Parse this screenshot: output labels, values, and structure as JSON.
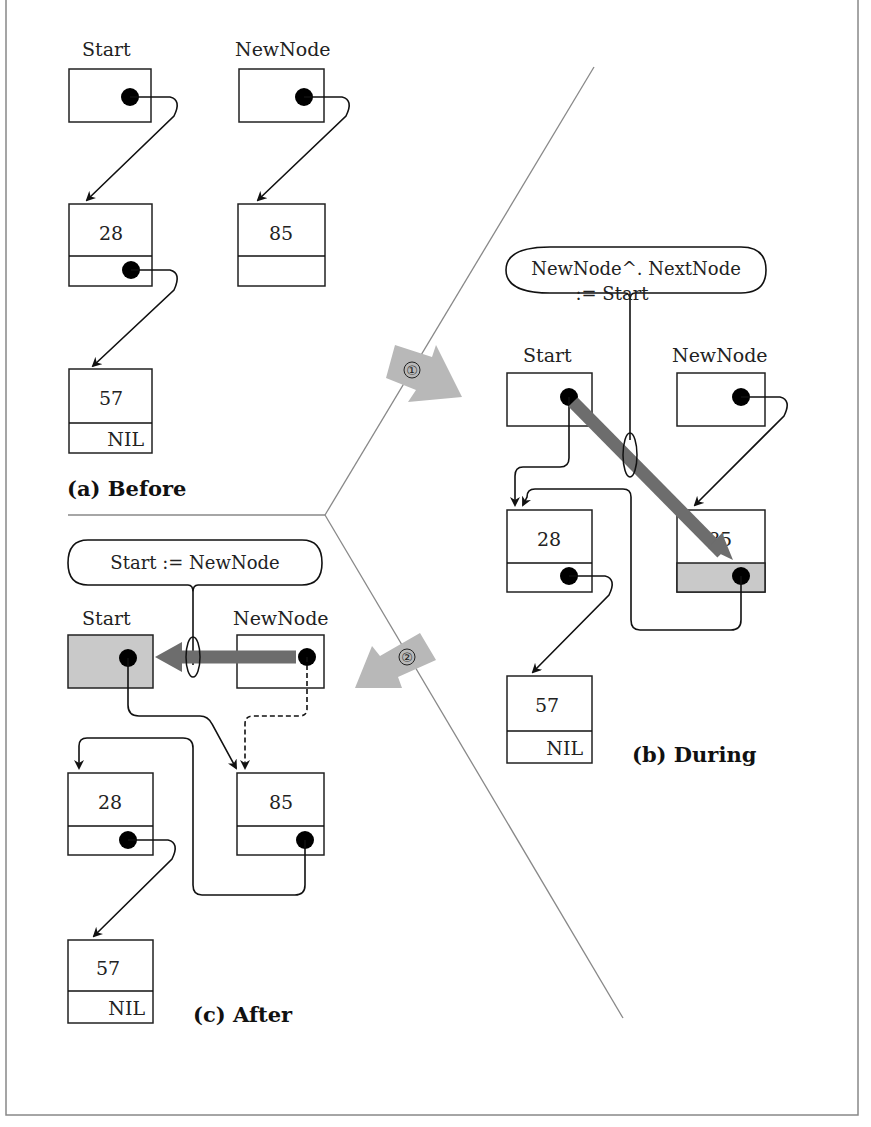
{
  "figure": {
    "panels": {
      "before": {
        "caption": "(a)  Before",
        "pointers": [
          {
            "name": "Start",
            "points_to": "28"
          },
          {
            "name": "NewNode",
            "points_to": "85"
          }
        ],
        "nodes": [
          {
            "value": "28",
            "next": "57"
          },
          {
            "value": "85",
            "next": ""
          },
          {
            "value": "57",
            "next": "NIL"
          }
        ]
      },
      "during": {
        "caption": "(b)  During",
        "statement_line1": "NewNode^. NextNode",
        "statement_line2": ":=  Start",
        "pointers": [
          {
            "name": "Start",
            "points_to": "28"
          },
          {
            "name": "NewNode",
            "points_to": "85"
          }
        ],
        "nodes": [
          {
            "value": "28",
            "next": "57"
          },
          {
            "value": "85",
            "next": "28"
          },
          {
            "value": "57",
            "next": "NIL"
          }
        ]
      },
      "after": {
        "caption": "(c)  After",
        "statement": "Start  :=  NewNode",
        "pointers": [
          {
            "name": "Start",
            "points_to": "85"
          },
          {
            "name": "NewNode",
            "points_to": "85"
          }
        ],
        "nodes": [
          {
            "value": "28",
            "next": "57"
          },
          {
            "value": "85",
            "next": "28"
          },
          {
            "value": "57",
            "next": "NIL"
          }
        ]
      }
    },
    "steps": [
      {
        "number": "①",
        "direction": "before-to-during"
      },
      {
        "number": "②",
        "direction": "during-to-after"
      }
    ],
    "colors": {
      "highlight_fill": "#c9c9c9",
      "fat_arrow": "#6d6d6d",
      "step_arrow": "#b8b8b8",
      "divider": "#888888"
    }
  }
}
